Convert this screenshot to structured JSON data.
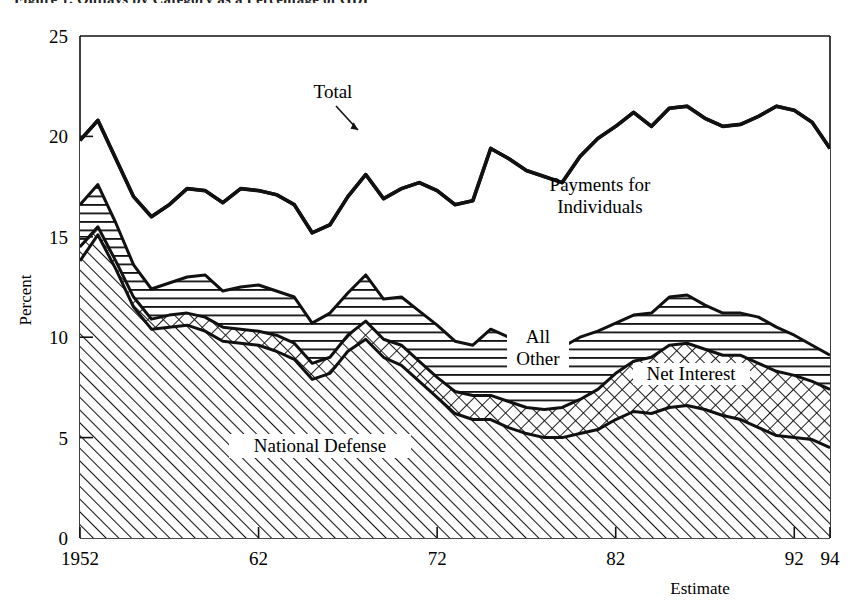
{
  "figure": {
    "clipped_title": "Figure 1.  Outlays by Category as a Percentage of GDP",
    "y_axis": {
      "label": "Percent",
      "ticks": [
        0,
        5,
        10,
        15,
        20,
        25
      ],
      "tick_labels": [
        "0",
        "5",
        "10",
        "15",
        "20",
        "25"
      ],
      "range": [
        0,
        25
      ]
    },
    "x_axis": {
      "label": "Estimate",
      "ticks": [
        1952,
        1962,
        1972,
        1982,
        1992,
        1994
      ],
      "tick_labels": [
        "1952",
        "62",
        "72",
        "82",
        "92",
        "94"
      ],
      "range": [
        1952,
        1994
      ]
    },
    "annotations": [
      {
        "name": "total-callout",
        "text": "Total"
      },
      {
        "name": "payments-label",
        "line1": "Payments for",
        "line2": "Individuals"
      },
      {
        "name": "all-other-label",
        "line1": "All",
        "line2": "Other"
      },
      {
        "name": "net-interest-label",
        "text": "Net Interest"
      },
      {
        "name": "national-defense-label",
        "text": "National Defense"
      }
    ],
    "colors": {
      "ink": "#000000",
      "paper": "#ffffff",
      "line": "#111111"
    }
  },
  "chart_data": {
    "type": "area",
    "title": "Figure 1.  Outlays by Category as a Percentage of GDP",
    "xlabel": "Estimate",
    "ylabel": "Percent",
    "xlim": [
      1952,
      1994
    ],
    "ylim": [
      0,
      25
    ],
    "grid": false,
    "legend": "inline-area-labels",
    "stacked": true,
    "stack_order": [
      "National Defense",
      "Net Interest",
      "All Other",
      "Payments for Individuals"
    ],
    "x": [
      1952,
      1953,
      1954,
      1955,
      1956,
      1957,
      1958,
      1959,
      1960,
      1961,
      1962,
      1963,
      1964,
      1965,
      1966,
      1967,
      1968,
      1969,
      1970,
      1971,
      1972,
      1973,
      1974,
      1975,
      1976,
      1977,
      1978,
      1979,
      1980,
      1981,
      1982,
      1983,
      1984,
      1985,
      1986,
      1987,
      1988,
      1989,
      1990,
      1991,
      1992,
      1993,
      1994
    ],
    "series": [
      {
        "name": "National Defense",
        "pattern": "diagonal-hatch",
        "values": [
          13.8,
          15.1,
          13.4,
          11.5,
          10.4,
          10.5,
          10.6,
          10.3,
          9.8,
          9.7,
          9.6,
          9.3,
          8.9,
          7.9,
          8.2,
          9.3,
          9.9,
          9.0,
          8.6,
          7.8,
          7.0,
          6.2,
          5.9,
          5.9,
          5.5,
          5.2,
          5.0,
          5.0,
          5.2,
          5.4,
          5.9,
          6.3,
          6.2,
          6.5,
          6.6,
          6.4,
          6.1,
          5.9,
          5.5,
          5.1,
          5.0,
          4.9,
          4.5
        ]
      },
      {
        "name": "Net Interest",
        "pattern": "cross-hatch",
        "values": [
          0.7,
          0.4,
          0.4,
          0.5,
          0.5,
          0.6,
          0.6,
          0.7,
          0.7,
          0.7,
          0.7,
          0.8,
          0.8,
          0.8,
          0.8,
          0.8,
          0.9,
          0.9,
          1.0,
          1.0,
          1.0,
          1.1,
          1.2,
          1.2,
          1.3,
          1.3,
          1.4,
          1.5,
          1.7,
          2.0,
          2.3,
          2.5,
          2.8,
          3.1,
          3.1,
          3.0,
          3.0,
          3.2,
          3.2,
          3.2,
          3.1,
          2.9,
          2.9
        ]
      },
      {
        "name": "All Other",
        "pattern": "horizontal-lines",
        "values": [
          2.1,
          2.1,
          1.9,
          1.6,
          1.5,
          1.6,
          1.8,
          2.1,
          1.8,
          2.1,
          2.3,
          2.2,
          2.3,
          2.0,
          2.2,
          2.1,
          2.3,
          2.0,
          2.4,
          2.5,
          2.6,
          2.5,
          2.5,
          3.3,
          3.2,
          3.2,
          3.3,
          3.0,
          3.1,
          2.9,
          2.5,
          2.3,
          2.2,
          2.4,
          2.4,
          2.2,
          2.1,
          2.1,
          2.3,
          2.2,
          2.0,
          1.8,
          1.7
        ]
      },
      {
        "name": "Payments for Individuals",
        "pattern": "plain",
        "values": [
          3.2,
          3.2,
          3.2,
          3.4,
          3.6,
          3.9,
          4.4,
          4.2,
          4.4,
          4.9,
          4.7,
          4.8,
          4.6,
          4.5,
          4.4,
          4.8,
          5.0,
          5.0,
          5.4,
          6.4,
          6.7,
          6.8,
          7.2,
          9.0,
          8.9,
          8.6,
          8.3,
          8.2,
          9.0,
          9.6,
          9.8,
          10.1,
          9.3,
          9.4,
          9.4,
          9.3,
          9.3,
          9.4,
          10.0,
          11.0,
          11.2,
          11.1,
          10.3
        ]
      }
    ],
    "total": {
      "name": "Total",
      "values": [
        19.8,
        20.8,
        18.9,
        17.0,
        16.0,
        16.6,
        17.4,
        17.3,
        16.7,
        17.4,
        17.3,
        17.1,
        16.6,
        15.2,
        15.6,
        17.0,
        18.1,
        16.9,
        17.4,
        17.7,
        17.3,
        16.6,
        16.8,
        19.4,
        18.9,
        18.3,
        18.0,
        17.7,
        19.0,
        19.9,
        20.5,
        21.2,
        20.5,
        21.4,
        21.5,
        20.9,
        20.5,
        20.6,
        21.0,
        21.5,
        21.3,
        20.7,
        19.4
      ]
    }
  }
}
